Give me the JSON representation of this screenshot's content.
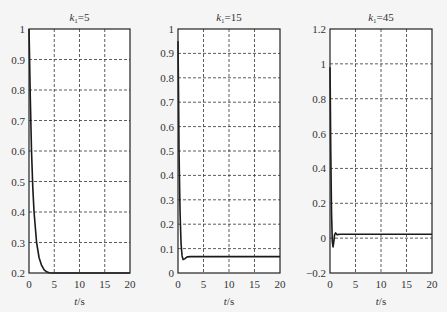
{
  "chart_data": [
    {
      "type": "line",
      "title": "k1=5",
      "title_main": "k",
      "title_sub": "1",
      "title_rest": "=5",
      "xlabel": "t/s",
      "ylabel": "",
      "xlim": [
        0,
        20
      ],
      "ylim": [
        0.2,
        1
      ],
      "xticks": [
        0,
        5,
        10,
        15,
        20
      ],
      "yticks": [
        0.2,
        0.3,
        0.4,
        0.5,
        0.6,
        0.7,
        0.8,
        0.9,
        1
      ],
      "ytick_labels": [
        "0.2",
        "0.3",
        "0.4",
        "0.5",
        "0.6",
        "0.7",
        "0.8",
        "0.9",
        "1"
      ],
      "grid": true,
      "series": [
        {
          "name": "response",
          "x": [
            0,
            0.1,
            0.25,
            0.5,
            0.75,
            1.0,
            1.5,
            2.0,
            2.5,
            3.0,
            3.5,
            4.0,
            5.0,
            10,
            20
          ],
          "values": [
            1.0,
            0.92,
            0.78,
            0.6,
            0.48,
            0.4,
            0.3,
            0.25,
            0.225,
            0.21,
            0.204,
            0.201,
            0.2,
            0.2,
            0.2
          ]
        }
      ],
      "frame": {
        "left": 29,
        "top": 29,
        "right": 130,
        "bottom": 273
      }
    },
    {
      "type": "line",
      "title": "k1=15",
      "title_main": "k",
      "title_sub": "1",
      "title_rest": "=15",
      "xlabel": "t/s",
      "ylabel": "",
      "xlim": [
        0,
        20
      ],
      "ylim": [
        0,
        1
      ],
      "xticks": [
        0,
        5,
        10,
        15,
        20
      ],
      "yticks": [
        0,
        0.1,
        0.2,
        0.3,
        0.4,
        0.5,
        0.6,
        0.7,
        0.8,
        0.9,
        1
      ],
      "ytick_labels": [
        "0",
        "0.1",
        "0.2",
        "0.3",
        "0.4",
        "0.5",
        "0.6",
        "0.7",
        "0.8",
        "0.9",
        "1"
      ],
      "grid": true,
      "series": [
        {
          "name": "response",
          "x": [
            0,
            0.1,
            0.2,
            0.4,
            0.6,
            0.8,
            1.0,
            1.3,
            1.8,
            2.5,
            5,
            10,
            20
          ],
          "values": [
            0.95,
            0.75,
            0.5,
            0.25,
            0.12,
            0.07,
            0.055,
            0.058,
            0.066,
            0.067,
            0.067,
            0.067,
            0.067
          ]
        }
      ],
      "frame": {
        "left": 178,
        "top": 29,
        "right": 280,
        "bottom": 273
      }
    },
    {
      "type": "line",
      "title": "k1=45",
      "title_main": "k",
      "title_sub": "1",
      "title_rest": "=45",
      "xlabel": "t/s",
      "ylabel": "",
      "xlim": [
        0,
        20
      ],
      "ylim": [
        -0.2,
        1.2
      ],
      "xticks": [
        0,
        5,
        10,
        15,
        20
      ],
      "yticks": [
        -0.2,
        0,
        0.2,
        0.4,
        0.6,
        0.8,
        1,
        1.2
      ],
      "ytick_labels": [
        "−0.2",
        "0",
        "0.2",
        "0.4",
        "0.6",
        "0.8",
        "1",
        "1.2"
      ],
      "grid": true,
      "series": [
        {
          "name": "response",
          "x": [
            0,
            0.05,
            0.15,
            0.3,
            0.45,
            0.6,
            0.75,
            0.9,
            1.1,
            1.4,
            2,
            5,
            10,
            20
          ],
          "values": [
            0.98,
            0.85,
            0.5,
            0.15,
            -0.02,
            -0.05,
            -0.02,
            0.02,
            0.03,
            0.02,
            0.022,
            0.022,
            0.022,
            0.022
          ]
        }
      ],
      "frame": {
        "left": 330,
        "top": 29,
        "right": 432,
        "bottom": 273
      }
    }
  ],
  "style": {
    "background": "#f5f5f5",
    "line_color": "#1a1a1a",
    "grid_color": "#333333",
    "frame_color": "#222222"
  }
}
